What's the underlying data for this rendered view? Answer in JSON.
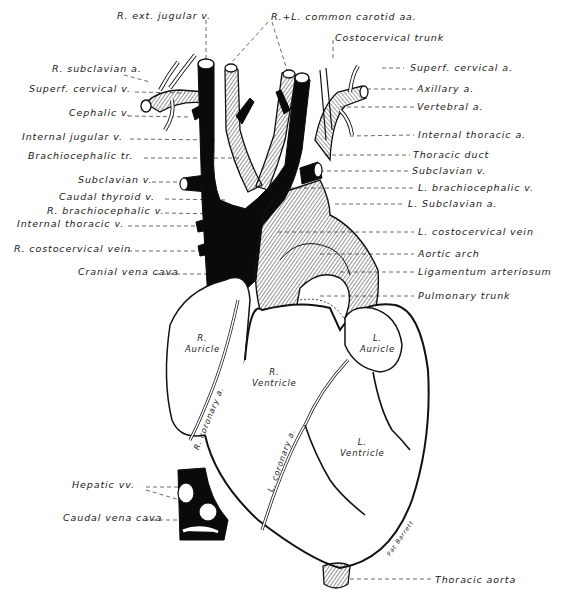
{
  "figure": {
    "signature": "Pat Barrett"
  },
  "labels_left": [
    {
      "id": "r-ext-jugular-v",
      "text": "R. ext. jugular v.",
      "x": 117,
      "y": 15
    },
    {
      "id": "r-subclavian-a",
      "text": "R. subclavian a.",
      "x": 52,
      "y": 68
    },
    {
      "id": "superf-cervical-v",
      "text": "Superf. cervical v.",
      "x": 29,
      "y": 88
    },
    {
      "id": "cephalic-v",
      "text": "Cephalic v.",
      "x": 69,
      "y": 112
    },
    {
      "id": "internal-jugular-v",
      "text": "Internal jugular v.",
      "x": 22,
      "y": 135
    },
    {
      "id": "brachiocephalic-tr",
      "text": "Brachiocephalic tr.",
      "x": 28,
      "y": 154
    },
    {
      "id": "subclavian-v-left",
      "text": "Subclavian v.",
      "x": 78,
      "y": 178
    },
    {
      "id": "caudal-thyroid-v",
      "text": "Caudal thyroid v.",
      "x": 59,
      "y": 195
    },
    {
      "id": "r-brachiocephalic-v",
      "text": "R. brachiocephalic v.",
      "x": 47,
      "y": 209
    },
    {
      "id": "internal-thoracic-v",
      "text": "Internal thoracic v.",
      "x": 17,
      "y": 222
    },
    {
      "id": "r-costocervical-vein",
      "text": "R. costocervical vein",
      "x": 14,
      "y": 247
    },
    {
      "id": "cranial-vena-cava",
      "text": "Cranial vena cava",
      "x": 78,
      "y": 270
    },
    {
      "id": "hepatic-vv",
      "text": "Hepatic vv.",
      "x": 72,
      "y": 483
    },
    {
      "id": "caudal-vena-cava",
      "text": "Caudal vena cava",
      "x": 63,
      "y": 516
    }
  ],
  "labels_right": [
    {
      "id": "r-l-common-carotid-aa",
      "text": "R.+L. common carotid aa.",
      "x": 271,
      "y": 16
    },
    {
      "id": "costocervical-trunk",
      "text": "Costocervical trunk",
      "x": 335,
      "y": 36
    },
    {
      "id": "superf-cervical-a",
      "text": "Superf. cervical a.",
      "x": 410,
      "y": 64
    },
    {
      "id": "axillary-a",
      "text": "Axillary  a.",
      "x": 417,
      "y": 85
    },
    {
      "id": "vertebral-a",
      "text": "Vertebral  a.",
      "x": 417,
      "y": 103
    },
    {
      "id": "internal-thoracic-a",
      "text": "Internal  thoracic  a.",
      "x": 418,
      "y": 131
    },
    {
      "id": "thoracic-duct",
      "text": "Thoracic duct",
      "x": 413,
      "y": 151
    },
    {
      "id": "subclavian-v-right",
      "text": "Subclavian v.",
      "x": 412,
      "y": 167
    },
    {
      "id": "l-brachiocephalic-v",
      "text": "L. brachiocephalic v.",
      "x": 418,
      "y": 184
    },
    {
      "id": "l-subclavian-a",
      "text": "L. Subclavian  a.",
      "x": 408,
      "y": 200
    },
    {
      "id": "l-costocervical-vein",
      "text": "L. costocervical  vein",
      "x": 418,
      "y": 228
    },
    {
      "id": "aortic-arch",
      "text": "Aortic  arch",
      "x": 418,
      "y": 250
    },
    {
      "id": "ligamentum-arteriosum",
      "text": "Ligamentum  arteriosum",
      "x": 418,
      "y": 268
    },
    {
      "id": "pulmonary-trunk",
      "text": "Pulmonary  trunk",
      "x": 418,
      "y": 292
    },
    {
      "id": "thoracic-aorta",
      "text": "Thoracic  aorta",
      "x": 435,
      "y": 576
    }
  ],
  "organ_labels": [
    {
      "id": "r-auricle",
      "lines": [
        "R.",
        "Auricle"
      ],
      "x": 182,
      "y": 335
    },
    {
      "id": "r-ventricle",
      "lines": [
        "R.",
        "Ventricle"
      ],
      "x": 253,
      "y": 368
    },
    {
      "id": "l-auricle",
      "lines": [
        "L.",
        "Auricle"
      ],
      "x": 357,
      "y": 335
    },
    {
      "id": "l-ventricle",
      "lines": [
        "L.",
        "Ventricle"
      ],
      "x": 343,
      "y": 438
    }
  ],
  "rotated_labels": [
    {
      "id": "r-coronary-a",
      "text": "R. coronary a.",
      "x": 193,
      "y": 450,
      "angle": -68
    },
    {
      "id": "l-coronary-a",
      "text": "L. coronary a.",
      "x": 263,
      "y": 483,
      "angle": -70
    }
  ],
  "colors": {
    "ink": "#111111",
    "paper": "#ffffff",
    "leader": "#444444"
  }
}
